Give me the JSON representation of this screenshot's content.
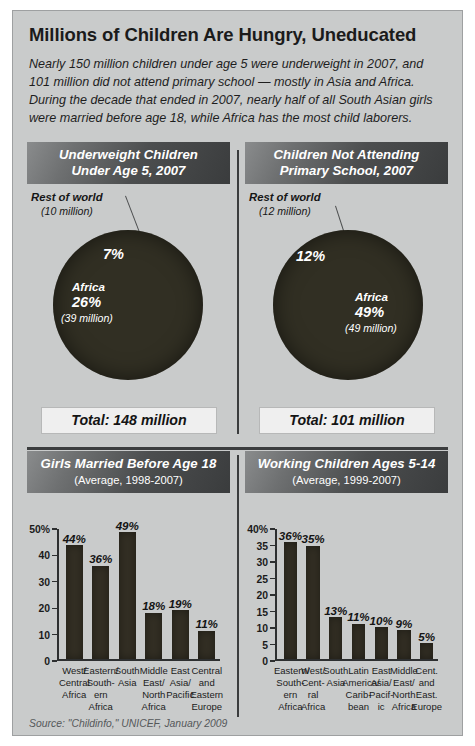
{
  "header": {
    "title": "Millions of Children Are Hungry,  Uneducated",
    "deck": "Nearly 150 million children under age 5 were underweight in 2007, and 101 million did not attend primary school — mostly in Asia and Africa. During the decade that ended in 2007, nearly half of all South Asian girls were married before age 18, while Africa has the most child laborers."
  },
  "source": "Source: \"Childinfo,\" UNICEF, January 2009",
  "colors": {
    "background": "#c9cbcb",
    "panel_header_dark": "#3a3c3d",
    "data_dark": "#332f24",
    "total_box": "#efefef",
    "text": "#1b1b1b"
  },
  "panels": {
    "pie_left": {
      "title_line1": "Underweight Children",
      "title_line2": "Under Age 5, 2007",
      "callout_label": "Rest of world",
      "callout_value": "(10 million)",
      "total": "Total: 148 million"
    },
    "pie_right": {
      "title_line1": "Children Not Attending",
      "title_line2": "Primary School, 2007",
      "callout_label": "Rest of world",
      "callout_value": "(12 million)",
      "total": "Total: 101 million"
    },
    "bar_left": {
      "title": "Girls Married Before Age 18",
      "subtitle": "(Average, 1998-2007)"
    },
    "bar_right": {
      "title": "Working Children Ages 5-14",
      "subtitle": "(Average, 1999-2007)"
    }
  },
  "chart_data": [
    {
      "type": "pie",
      "title": "Underweight Children Under Age 5, 2007",
      "total_label": "Total: 148 million",
      "total_value": 148,
      "unit": "million",
      "slices": [
        {
          "name": "Rest of world",
          "percent": 7,
          "value": 10,
          "value_label": "(10 million)",
          "pct_label": "7%"
        },
        {
          "name": "Africa",
          "percent": 26,
          "value": 39,
          "value_label": "(39 million)",
          "pct_label": "26%"
        },
        {
          "name": "Asia",
          "percent": 67,
          "value": 99,
          "value_label": "",
          "pct_label": ""
        }
      ],
      "legend": "none"
    },
    {
      "type": "pie",
      "title": "Children Not Attending Primary School, 2007",
      "total_label": "Total: 101 million",
      "total_value": 101,
      "unit": "million",
      "slices": [
        {
          "name": "Rest of world",
          "percent": 12,
          "value": 12,
          "value_label": "(12 million)",
          "pct_label": "12%"
        },
        {
          "name": "Africa",
          "percent": 49,
          "value": 49,
          "value_label": "(49 million)",
          "pct_label": "49%"
        },
        {
          "name": "Asia",
          "percent": 39,
          "value": 40,
          "value_label": "",
          "pct_label": ""
        }
      ],
      "legend": "none"
    },
    {
      "type": "bar",
      "title": "Girls Married Before Age 18",
      "subtitle": "(Average, 1998-2007)",
      "xlabel": "",
      "ylabel": "",
      "ylim": [
        0,
        50
      ],
      "yticks": [
        0,
        10,
        20,
        30,
        40,
        50
      ],
      "ytick_labels": [
        "0",
        "10",
        "20",
        "30",
        "40",
        "50%"
      ],
      "grid": false,
      "categories": [
        "West/\nCentral\nAfrica",
        "Eastern/\nSouth-\nern\nAfrica",
        "South\nAsia",
        "Middle\nEast/\nNorth\nAfrica",
        "East\nAsia/\nPacific",
        "Central\nand\nEastern\nEurope"
      ],
      "values": [
        44,
        36,
        49,
        18,
        19,
        11
      ],
      "value_labels": [
        "44%",
        "36%",
        "49%",
        "18%",
        "19%",
        "11%"
      ]
    },
    {
      "type": "bar",
      "title": "Working Children Ages 5-14",
      "subtitle": "(Average, 1999-2007)",
      "xlabel": "",
      "ylabel": "",
      "ylim": [
        0,
        40
      ],
      "yticks": [
        0,
        5,
        10,
        15,
        20,
        25,
        30,
        35,
        40
      ],
      "ytick_labels": [
        "0",
        "5",
        "10",
        "15",
        "20",
        "25",
        "30",
        "35",
        "40%"
      ],
      "grid": false,
      "categories": [
        "Eastern/\nSouth-\nern\nAfrica",
        "West/\nCent-\nral\nAfrica",
        "South\nAsia",
        "Latin\nAmerica/\nCarib-\nbean",
        "East\nAsia/\nPacif-\nic",
        "Middle\nEast/\nNorth\nAfrica",
        "Cent.\nand\nEast.\nEurope"
      ],
      "values": [
        36,
        35,
        13,
        11,
        10,
        9,
        5
      ],
      "value_labels": [
        "36%",
        "35%",
        "13%",
        "11%",
        "10%",
        "9%",
        "5%"
      ]
    }
  ]
}
